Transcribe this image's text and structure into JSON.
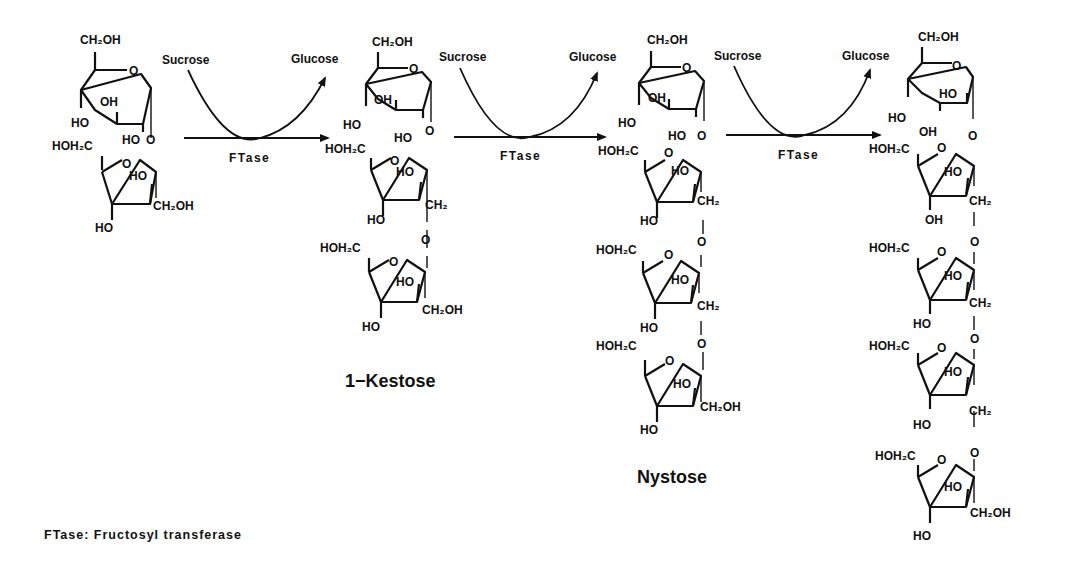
{
  "diagram": {
    "type": "reaction-pathway",
    "steps": [
      {
        "reactant": "Sucrose",
        "co_substrate": "Sucrose",
        "byproduct": "Glucose",
        "enzyme": "FTase",
        "product": "1-Kestose"
      },
      {
        "reactant": "1-Kestose",
        "co_substrate": "Sucrose",
        "byproduct": "Glucose",
        "enzyme": "FTase",
        "product": "Nystose"
      },
      {
        "reactant": "Nystose",
        "co_substrate": "Sucrose",
        "byproduct": "Glucose",
        "enzyme": "FTase",
        "product": "1F-Fructofuranosyl nystose"
      }
    ],
    "arrows": [
      {
        "above_left": "Sucrose",
        "above_right": "Glucose",
        "below": "FTase"
      },
      {
        "above_left": "Sucrose",
        "above_right": "Glucose",
        "below": "FTase"
      },
      {
        "above_left": "Sucrose",
        "above_right": "Glucose",
        "below": "FTase"
      }
    ],
    "molecule_names": {
      "kestose": "1−Kestose",
      "nystose": "Nystose"
    },
    "groups": {
      "ch2oh": "CH₂OH",
      "hoh2c": "HOH₂C",
      "ch2": "CH₂",
      "oh": "OH",
      "ho": "HO",
      "o": "O"
    },
    "footnote": "FTase: Fructosyl transferase"
  }
}
